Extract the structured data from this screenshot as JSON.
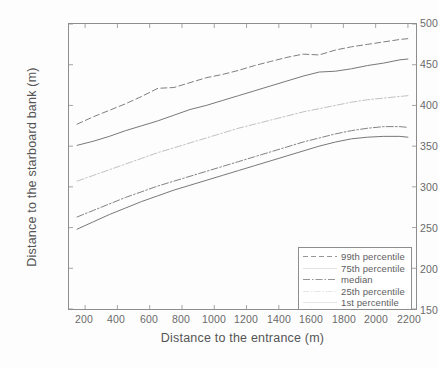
{
  "chart_data": {
    "type": "line",
    "title": "",
    "xlabel": "Distance to the entrance (m)",
    "ylabel": "Distance to the starboard bank (m)",
    "xlim": [
      100,
      2250
    ],
    "ylim": [
      150,
      500
    ],
    "xticks": [
      200,
      400,
      600,
      800,
      1000,
      1200,
      1400,
      1600,
      1800,
      2000,
      2200
    ],
    "yticks": [
      150,
      200,
      250,
      300,
      350,
      400,
      450,
      500
    ],
    "grid": false,
    "legend_position": "lower right",
    "x": [
      150,
      250,
      350,
      450,
      550,
      650,
      750,
      850,
      950,
      1050,
      1150,
      1250,
      1350,
      1450,
      1550,
      1650,
      1750,
      1850,
      1950,
      2050,
      2150,
      2200
    ],
    "series": [
      {
        "name": "99th percentile",
        "style": "dashed",
        "color": "#777777",
        "values": [
          377,
          386,
          394,
          402,
          411,
          421,
          422,
          428,
          434,
          438,
          443,
          449,
          454,
          459,
          463,
          462,
          468,
          472,
          475,
          478,
          481,
          482
        ]
      },
      {
        "name": "75th percentile",
        "style": "solid",
        "color": "#707070",
        "values": [
          351,
          356,
          362,
          369,
          375,
          381,
          388,
          395,
          400,
          406,
          412,
          418,
          424,
          430,
          436,
          441,
          442,
          445,
          449,
          452,
          456,
          457
        ]
      },
      {
        "name": "median",
        "style": "dashdot",
        "color": "#bdbdbd",
        "values": [
          307,
          314,
          321,
          328,
          335,
          342,
          348,
          354,
          360,
          366,
          372,
          377,
          382,
          387,
          392,
          396,
          400,
          404,
          407,
          409,
          411,
          412
        ]
      },
      {
        "name": "25th percentile",
        "style": "dashdot",
        "color": "#7a7a7a",
        "values": [
          263,
          271,
          279,
          287,
          294,
          301,
          307,
          313,
          319,
          325,
          331,
          337,
          343,
          349,
          355,
          360,
          365,
          369,
          372,
          374,
          374,
          373
        ]
      },
      {
        "name": "1st percentile",
        "style": "solid",
        "color": "#707070",
        "values": [
          248,
          257,
          266,
          274,
          282,
          289,
          296,
          302,
          308,
          314,
          320,
          326,
          332,
          338,
          344,
          350,
          355,
          359,
          361,
          362,
          362,
          361
        ]
      }
    ]
  },
  "axes": {
    "xlabel": "Distance to the entrance (m)",
    "ylabel": "Distance to the starboard bank (m)",
    "xticks": [
      "200",
      "400",
      "600",
      "800",
      "1000",
      "1200",
      "1400",
      "1600",
      "1800",
      "2000",
      "2200"
    ],
    "yticks": [
      "500",
      "450",
      "400",
      "350",
      "300",
      "250",
      "200",
      "150"
    ]
  },
  "legend": {
    "entries": [
      {
        "label": "99th percentile"
      },
      {
        "label": "75th percentile"
      },
      {
        "label": "median"
      },
      {
        "label": "25th percentile"
      },
      {
        "label": "1st percentile"
      }
    ]
  }
}
